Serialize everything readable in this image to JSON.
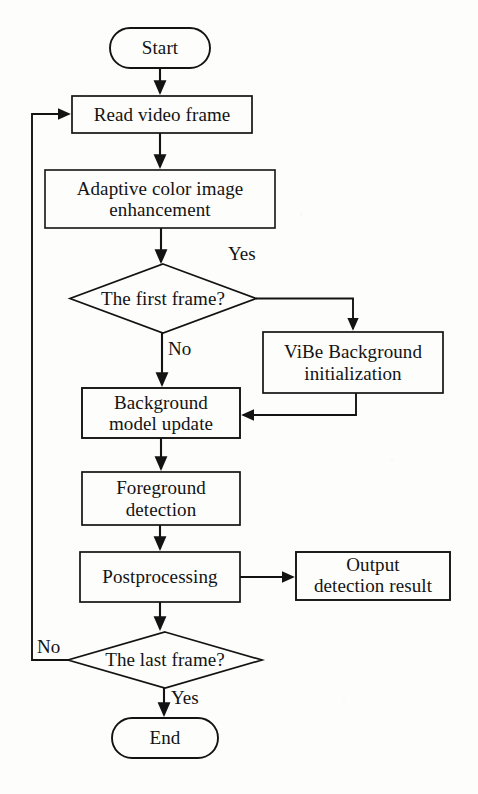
{
  "figure": {
    "type": "flowchart",
    "background_color": "#fdfdfc",
    "stroke_color": "#131313",
    "text_color": "#131313",
    "caption": ""
  },
  "nodes": [
    {
      "id": "start",
      "shape": "terminal",
      "label": "Start",
      "x": 110,
      "y": 28,
      "w": 100,
      "h": 40
    },
    {
      "id": "read",
      "shape": "process",
      "label": "Read video frame",
      "x": 72,
      "y": 96,
      "w": 180,
      "h": 37
    },
    {
      "id": "enhance",
      "shape": "process",
      "label": "Adaptive color image\nenhancement",
      "x": 45,
      "y": 170,
      "w": 230,
      "h": 58
    },
    {
      "id": "first",
      "shape": "decision",
      "label": "The first frame?",
      "x": 70,
      "y": 264,
      "w": 186,
      "h": 69
    },
    {
      "id": "vibe",
      "shape": "process",
      "label": "ViBe Background\ninitialization",
      "x": 263,
      "y": 332,
      "w": 180,
      "h": 61
    },
    {
      "id": "bgupdate",
      "shape": "process",
      "label": "Background\nmodel update",
      "x": 82,
      "y": 388,
      "w": 158,
      "h": 50
    },
    {
      "id": "foreground",
      "shape": "process",
      "label": "Foreground\ndetection",
      "x": 82,
      "y": 472,
      "w": 158,
      "h": 53
    },
    {
      "id": "postproc",
      "shape": "process",
      "label": "Postprocessing",
      "x": 80,
      "y": 552,
      "w": 160,
      "h": 50
    },
    {
      "id": "output",
      "shape": "process",
      "label": "Output\ndetection result",
      "x": 296,
      "y": 552,
      "w": 154,
      "h": 48
    },
    {
      "id": "last",
      "shape": "decision",
      "label": "The last frame?",
      "x": 68,
      "y": 632,
      "w": 194,
      "h": 56
    },
    {
      "id": "end",
      "shape": "terminal",
      "label": "End",
      "x": 112,
      "y": 718,
      "w": 106,
      "h": 40
    }
  ],
  "node_lines": {
    "start": [
      "Start"
    ],
    "read": [
      "Read video frame"
    ],
    "enhance": [
      "Adaptive color image",
      "enhancement"
    ],
    "first": [
      "The first frame?"
    ],
    "vibe": [
      "ViBe Background",
      "initialization"
    ],
    "bgupdate": [
      "Background",
      "model update"
    ],
    "foreground": [
      "Foreground",
      "detection"
    ],
    "postproc": [
      "Postprocessing"
    ],
    "output": [
      "Output",
      "detection result"
    ],
    "last": [
      "The last frame?"
    ],
    "end": [
      "End"
    ]
  },
  "edges": [
    {
      "id": "e1",
      "from": "start",
      "to": "read",
      "label": ""
    },
    {
      "id": "e2",
      "from": "read",
      "to": "enhance",
      "label": ""
    },
    {
      "id": "e3",
      "from": "enhance",
      "to": "first",
      "label": ""
    },
    {
      "id": "e4",
      "from": "first",
      "to": "vibe",
      "label": "Yes"
    },
    {
      "id": "e5",
      "from": "first",
      "to": "bgupdate",
      "label": "No"
    },
    {
      "id": "e6",
      "from": "vibe",
      "to": "bgupdate",
      "label": ""
    },
    {
      "id": "e7",
      "from": "bgupdate",
      "to": "foreground",
      "label": ""
    },
    {
      "id": "e8",
      "from": "foreground",
      "to": "postproc",
      "label": ""
    },
    {
      "id": "e9",
      "from": "postproc",
      "to": "output",
      "label": ""
    },
    {
      "id": "e10",
      "from": "postproc",
      "to": "last",
      "label": ""
    },
    {
      "id": "e11",
      "from": "last",
      "to": "read",
      "label": "No"
    },
    {
      "id": "e12",
      "from": "last",
      "to": "end",
      "label": "Yes"
    }
  ],
  "edge_labels": {
    "yes_first": {
      "text": "Yes",
      "x": 228,
      "y": 243
    },
    "no_first": {
      "text": "No",
      "x": 168,
      "y": 338
    },
    "no_last": {
      "text": "No",
      "x": 37,
      "y": 636
    },
    "yes_last": {
      "text": "Yes",
      "x": 171,
      "y": 687
    }
  }
}
